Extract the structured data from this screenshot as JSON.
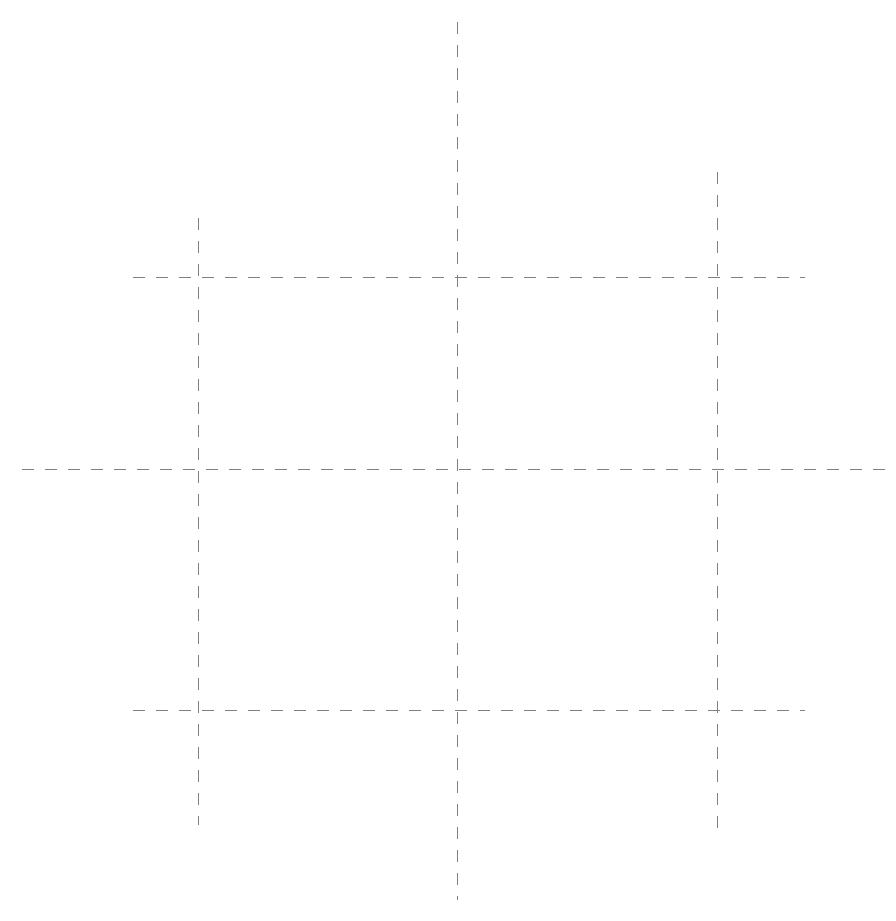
{
  "diagram": {
    "canvas": {
      "width": 896,
      "height": 921,
      "background_color": "#ffffff"
    },
    "style": {
      "stroke_color": "#808080",
      "stroke_width": 1,
      "dash_length": 12,
      "gap_length": 11,
      "dash_array": "12 11",
      "line_cap": "butt"
    },
    "lines": [
      {
        "id": "vertical-left",
        "name": "Left vertical guide",
        "orientation": "vertical",
        "x": 198,
        "y1": 218,
        "y2": 825,
        "length": 607
      },
      {
        "id": "vertical-center",
        "name": "Center vertical guide",
        "orientation": "vertical",
        "x": 457,
        "y1": 22,
        "y2": 900,
        "length": 878
      },
      {
        "id": "vertical-right",
        "name": "Right vertical guide",
        "orientation": "vertical",
        "x": 717,
        "y1": 172,
        "y2": 835,
        "length": 663
      },
      {
        "id": "horizontal-top",
        "name": "Top horizontal guide",
        "orientation": "horizontal",
        "y": 277,
        "x1": 133,
        "x2": 805,
        "length": 672
      },
      {
        "id": "horizontal-middle",
        "name": "Middle horizontal guide",
        "orientation": "horizontal",
        "y": 469,
        "x1": 22,
        "x2": 885,
        "length": 863
      },
      {
        "id": "horizontal-bottom",
        "name": "Bottom horizontal guide",
        "orientation": "horizontal",
        "y": 710,
        "x1": 133,
        "x2": 805,
        "length": 672
      }
    ],
    "intersections": [
      {
        "id": "intersection-top-left",
        "x": 198,
        "y": 277
      },
      {
        "id": "intersection-top-center",
        "x": 457,
        "y": 277
      },
      {
        "id": "intersection-top-right",
        "x": 717,
        "y": 277
      },
      {
        "id": "intersection-middle-left",
        "x": 198,
        "y": 469
      },
      {
        "id": "intersection-middle-center",
        "x": 457,
        "y": 469
      },
      {
        "id": "intersection-middle-right",
        "x": 717,
        "y": 469
      },
      {
        "id": "intersection-bottom-left",
        "x": 198,
        "y": 710
      },
      {
        "id": "intersection-bottom-center",
        "x": 457,
        "y": 710
      },
      {
        "id": "intersection-bottom-right",
        "x": 717,
        "y": 710
      }
    ]
  }
}
